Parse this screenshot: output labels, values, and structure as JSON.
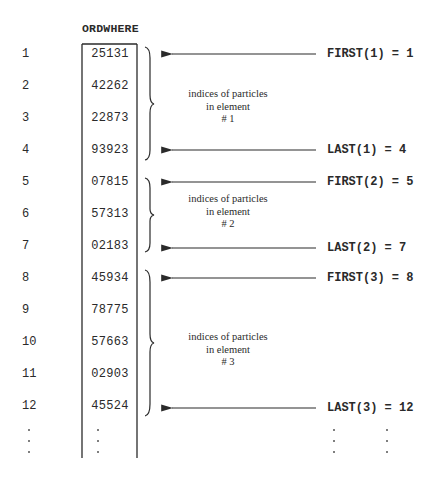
{
  "diagram": {
    "array_name": "ORDWHERE",
    "rows": [
      {
        "index": "1",
        "value": "25131"
      },
      {
        "index": "2",
        "value": "42262"
      },
      {
        "index": "3",
        "value": "22873"
      },
      {
        "index": "4",
        "value": "93923"
      },
      {
        "index": "5",
        "value": "07815"
      },
      {
        "index": "6",
        "value": "57313"
      },
      {
        "index": "7",
        "value": "02183"
      },
      {
        "index": "8",
        "value": "45934"
      },
      {
        "index": "9",
        "value": "78775"
      },
      {
        "index": "10",
        "value": "57663"
      },
      {
        "index": "11",
        "value": "02903"
      },
      {
        "index": "12",
        "value": "45524"
      }
    ],
    "ellipsis": ":",
    "groups": [
      {
        "element": 1,
        "note_lines": [
          "indices of particles",
          "in element",
          "# 1"
        ],
        "first_label": "FIRST(1) = 1",
        "last_label": "LAST(1) = 4",
        "first_row": 1,
        "last_row": 4
      },
      {
        "element": 2,
        "note_lines": [
          "indices of particles",
          "in element",
          "# 2"
        ],
        "first_label": "FIRST(2) = 5",
        "last_label": "LAST(2) = 7",
        "first_row": 5,
        "last_row": 7
      },
      {
        "element": 3,
        "note_lines": [
          "indices of particles",
          "in element",
          "# 3"
        ],
        "first_label": "FIRST(3) = 8",
        "last_label": "LAST(3) = 12",
        "first_row": 8,
        "last_row": 12
      }
    ],
    "colors": {
      "ink": "#2a2a2a",
      "background": "#ffffff"
    }
  }
}
